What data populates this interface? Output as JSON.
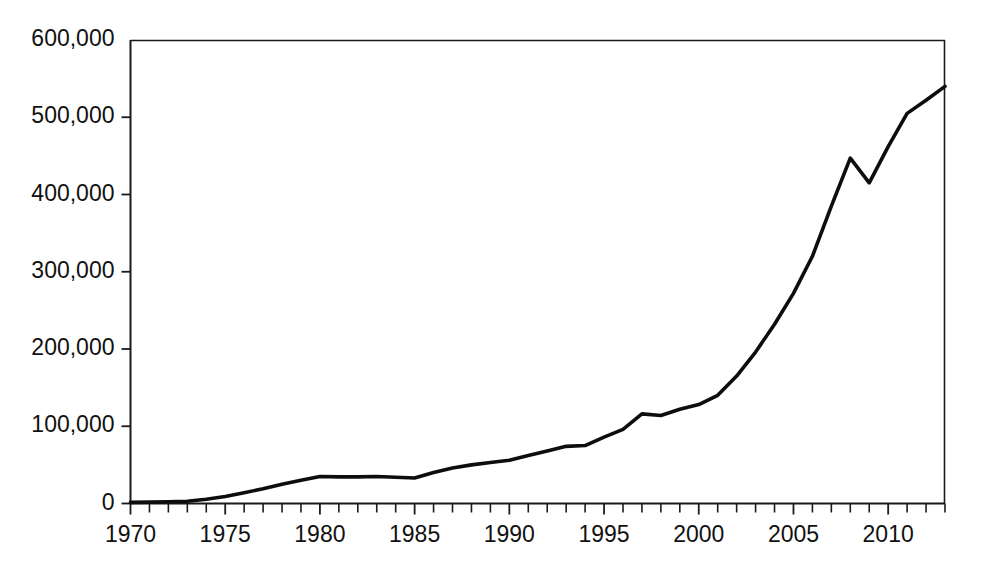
{
  "chart_data": {
    "type": "line",
    "title": "",
    "subtitle": "",
    "xlabel": "",
    "ylabel": "",
    "xlim": [
      1970,
      2013
    ],
    "ylim": [
      0,
      600000
    ],
    "grid": false,
    "legend": null,
    "y_ticks": [
      0,
      100000,
      200000,
      300000,
      400000,
      500000,
      600000
    ],
    "y_tick_labels": [
      "0",
      "100,000",
      "200,000",
      "300,000",
      "400,000",
      "500,000",
      "600,000"
    ],
    "x_tick_labels": [
      "1970",
      "1975",
      "1980",
      "1985",
      "1990",
      "1995",
      "2000",
      "2005",
      "2010"
    ],
    "x_tick_label_values": [
      1970,
      1975,
      1980,
      1985,
      1990,
      1995,
      2000,
      2005,
      2010
    ],
    "x_minor_tick_step": 1,
    "series": [
      {
        "name": "Value",
        "color": "#0d0d0d",
        "x": [
          1970,
          1971,
          1972,
          1973,
          1974,
          1975,
          1976,
          1977,
          1978,
          1979,
          1980,
          1981,
          1982,
          1983,
          1984,
          1985,
          1986,
          1987,
          1988,
          1989,
          1990,
          1991,
          1992,
          1993,
          1994,
          1995,
          1996,
          1997,
          1998,
          1999,
          2000,
          2001,
          2002,
          2003,
          2004,
          2005,
          2006,
          2007,
          2008,
          2009,
          2010,
          2011,
          2012,
          2013
        ],
        "values": [
          1500,
          1800,
          2200,
          3000,
          5500,
          9000,
          14000,
          19000,
          25000,
          30000,
          35000,
          34500,
          34500,
          35000,
          34000,
          33000,
          40000,
          46000,
          50000,
          53000,
          56000,
          62000,
          68000,
          74000,
          75000,
          86000,
          96000,
          116000,
          114000,
          122000,
          128000,
          140000,
          165000,
          196000,
          232000,
          272000,
          320000,
          385000,
          447000,
          415000,
          462000,
          505000,
          522000,
          540000
        ]
      }
    ]
  }
}
